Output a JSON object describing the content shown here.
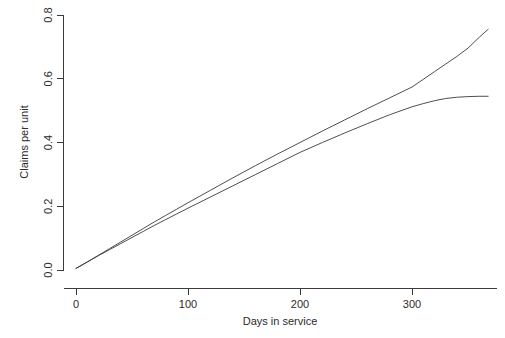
{
  "chart_data": {
    "type": "line",
    "title": "",
    "subtitle": "",
    "xlabel": "Days in service",
    "ylabel": "Claims per unit",
    "xlim": [
      -6,
      370
    ],
    "ylim": [
      -0.02,
      0.82
    ],
    "xticks": [
      0,
      100,
      200,
      300
    ],
    "xtick_labels": [
      "0",
      "100",
      "200",
      "300"
    ],
    "yticks": [
      0.0,
      0.2,
      0.4,
      0.6,
      0.8
    ],
    "ytick_labels": [
      "0.0",
      "0.2",
      "0.4",
      "0.6",
      "0.8"
    ],
    "grid": false,
    "legend": false,
    "legend_position": "none",
    "line_color": "#3a3a3a",
    "background_color": "#ffffff",
    "series": [
      {
        "name": "upper-curve",
        "x": [
          0,
          10,
          20,
          30,
          40,
          50,
          60,
          70,
          80,
          90,
          100,
          120,
          140,
          160,
          180,
          200,
          220,
          240,
          260,
          280,
          300,
          310,
          320,
          330,
          340,
          350,
          360,
          368
        ],
        "values": [
          0.005,
          0.025,
          0.046,
          0.067,
          0.088,
          0.109,
          0.13,
          0.151,
          0.171,
          0.191,
          0.211,
          0.25,
          0.289,
          0.327,
          0.364,
          0.4,
          0.436,
          0.471,
          0.506,
          0.54,
          0.574,
          0.598,
          0.622,
          0.646,
          0.67,
          0.696,
          0.73,
          0.755
        ]
      },
      {
        "name": "lower-curve",
        "x": [
          0,
          10,
          20,
          30,
          40,
          50,
          60,
          70,
          80,
          90,
          100,
          120,
          140,
          160,
          180,
          200,
          220,
          240,
          260,
          280,
          300,
          310,
          320,
          330,
          340,
          350,
          360,
          368
        ],
        "values": [
          0.005,
          0.025,
          0.045,
          0.064,
          0.083,
          0.102,
          0.121,
          0.14,
          0.158,
          0.176,
          0.194,
          0.229,
          0.264,
          0.299,
          0.334,
          0.369,
          0.4,
          0.43,
          0.459,
          0.487,
          0.512,
          0.522,
          0.531,
          0.538,
          0.542,
          0.544,
          0.545,
          0.545
        ]
      }
    ]
  }
}
